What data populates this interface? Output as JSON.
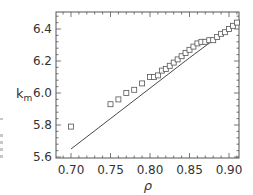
{
  "chart_data": {
    "type": "scatter",
    "title": "",
    "xlabel": "ρ",
    "ylabel": "k",
    "ylabel_subscript": "m",
    "xlim": [
      0.68,
      0.92
    ],
    "ylim": [
      5.6,
      6.5
    ],
    "xticks": [
      0.7,
      0.75,
      0.8,
      0.85,
      0.9
    ],
    "xtick_labels": [
      "0.70",
      "0.75",
      "0.80",
      "0.85",
      "0.90"
    ],
    "yticks": [
      5.6,
      5.8,
      6.0,
      6.2,
      6.4
    ],
    "ytick_labels": [
      "5.6",
      "5.8",
      "6.0",
      "6.2",
      "6.4"
    ],
    "grid": false,
    "legend": null,
    "series": [
      {
        "name": "data",
        "style": "open-square-markers",
        "x": [
          0.7,
          0.75,
          0.76,
          0.77,
          0.78,
          0.79,
          0.8,
          0.805,
          0.81,
          0.815,
          0.82,
          0.825,
          0.83,
          0.835,
          0.84,
          0.845,
          0.85,
          0.855,
          0.86,
          0.865,
          0.87,
          0.875,
          0.88,
          0.885,
          0.89,
          0.895,
          0.9,
          0.905,
          0.91
        ],
        "y": [
          5.79,
          5.93,
          5.96,
          6.0,
          6.02,
          6.06,
          6.1,
          6.1,
          6.11,
          6.14,
          6.15,
          6.17,
          6.19,
          6.21,
          6.23,
          6.25,
          6.27,
          6.29,
          6.31,
          6.32,
          6.32,
          6.33,
          6.33,
          6.35,
          6.37,
          6.38,
          6.4,
          6.42,
          6.44
        ]
      },
      {
        "name": "fit",
        "style": "solid-line",
        "x": [
          0.7,
          0.75,
          0.8,
          0.85,
          0.88,
          0.91
        ],
        "y": [
          5.65,
          5.84,
          6.03,
          6.22,
          6.33,
          6.43
        ]
      }
    ]
  },
  "colors": {
    "axis": "#555555",
    "marker": "#555555",
    "line": "#333333",
    "text": "#333333"
  }
}
